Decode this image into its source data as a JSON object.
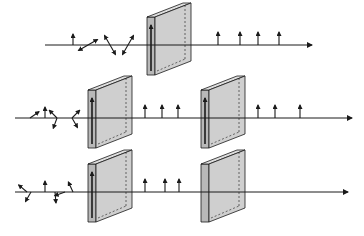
{
  "diagram": {
    "colors": {
      "line": "#1a1a1a",
      "plate_face": "#cfcfcf",
      "plate_side": "#b8b8b8",
      "plate_top": "#dedede",
      "background": "#ffffff"
    },
    "rows": [
      {
        "id": "single-polarizer",
        "axis_y": 45,
        "x_start": 45,
        "x_end": 312,
        "unpolarized_arrows": [
          {
            "x": 73,
            "angle": 90
          },
          {
            "x": 88,
            "angle": 30
          },
          {
            "x": 88,
            "angle": 210
          },
          {
            "x": 110,
            "angle": 120
          },
          {
            "x": 110,
            "angle": 300
          },
          {
            "x": 128,
            "angle": 60
          },
          {
            "x": 128,
            "angle": 240
          }
        ],
        "plates": [
          {
            "x": 147,
            "axis": "vertical"
          }
        ],
        "polarized_arrows": [
          218,
          240,
          258,
          279
        ]
      },
      {
        "id": "parallel-polarizers",
        "axis_y": 118,
        "x_start": 15,
        "x_end": 352,
        "unpolarized_arrows": [
          {
            "x": 30,
            "angle": 35
          },
          {
            "x": 45,
            "angle": 90
          },
          {
            "x": 57,
            "angle": 135
          },
          {
            "x": 57,
            "angle": 250
          },
          {
            "x": 72,
            "angle": 45
          },
          {
            "x": 72,
            "angle": 300
          }
        ],
        "plates": [
          {
            "x": 88,
            "axis": "vertical"
          },
          {
            "x": 201,
            "axis": "vertical"
          }
        ],
        "polarized_arrows": [
          145,
          162,
          178,
          258,
          275,
          300
        ]
      },
      {
        "id": "crossed-polarizers",
        "axis_y": 192,
        "x_start": 15,
        "x_end": 348,
        "unpolarized_arrows": [
          {
            "x": 27,
            "angle": 140
          },
          {
            "x": 31,
            "angle": 240
          },
          {
            "x": 45,
            "angle": 90
          },
          {
            "x": 55,
            "angle": 275
          },
          {
            "x": 65,
            "angle": 200
          },
          {
            "x": 73,
            "angle": 115
          }
        ],
        "plates": [
          {
            "x": 88,
            "axis": "vertical"
          },
          {
            "x": 201,
            "axis": "horizontal"
          }
        ],
        "polarized_arrows": [
          145,
          165,
          179
        ]
      }
    ]
  }
}
